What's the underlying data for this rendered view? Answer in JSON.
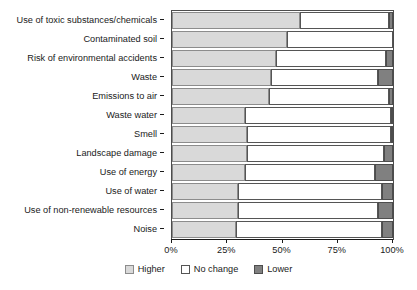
{
  "chart_data": {
    "type": "bar",
    "subtype": "stacked-horizontal-100",
    "title": "",
    "xlabel": "",
    "ylabel": "",
    "xlim": [
      0,
      100
    ],
    "grid": false,
    "legend_position": "bottom-center",
    "xticks": [
      0,
      25,
      50,
      75,
      100
    ],
    "xtick_labels": [
      "0%",
      "25%",
      "50%",
      "75%",
      "100%"
    ],
    "categories": [
      "Use of toxic substances/chemicals",
      "Contaminated soil",
      "Risk of environmental accidents",
      "Waste",
      "Emissions to air",
      "Waste water",
      "Smell",
      "Landscape damage",
      "Use of energy",
      "Use of water",
      "Use of non-renewable resources",
      "Noise"
    ],
    "series": [
      {
        "name": "Higher",
        "color": "#d9d9d9",
        "values": [
          58,
          52,
          47,
          45,
          44,
          33,
          34,
          34,
          33,
          30,
          30,
          29
        ]
      },
      {
        "name": "No change",
        "color": "#ffffff",
        "values": [
          40,
          48,
          50,
          48,
          54,
          66,
          65,
          62,
          59,
          65,
          63,
          66
        ]
      },
      {
        "name": "Lower",
        "color": "#808080",
        "values": [
          2,
          0,
          3,
          7,
          2,
          1,
          1,
          4,
          8,
          5,
          7,
          5
        ]
      }
    ],
    "legend": [
      {
        "label": "Higher",
        "swatch": "higher"
      },
      {
        "label": "No change",
        "swatch": "nochange"
      },
      {
        "label": "Lower",
        "swatch": "lower"
      }
    ],
    "colors": {
      "higher": "#d9d9d9",
      "no_change": "#ffffff",
      "lower": "#808080",
      "axis": "#1a1a1a",
      "bar_border": "#555555"
    }
  }
}
